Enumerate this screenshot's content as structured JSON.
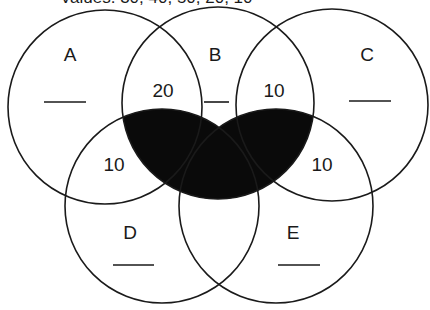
{
  "title": "Values: 30, 40, 50, 20, 10",
  "colors": {
    "stroke": "#1a1a1a",
    "shaded_region": "#0a0a0a",
    "background": "#ffffff"
  },
  "shaded_region_description": "B ∩ (D ∪ E)",
  "circles": [
    {
      "id": "A",
      "label": "A",
      "cx": 105,
      "cy": 107,
      "r": 97,
      "label_x": 70,
      "label_y": 56,
      "blank": {
        "x1": 44,
        "x2": 86,
        "y": 102
      }
    },
    {
      "id": "B",
      "label": "B",
      "cx": 218,
      "cy": 103,
      "r": 96,
      "label_x": 215,
      "label_y": 56,
      "blank": {
        "x1": 204,
        "x2": 229,
        "y": 102
      }
    },
    {
      "id": "C",
      "label": "C",
      "cx": 332,
      "cy": 105,
      "r": 96,
      "label_x": 367,
      "label_y": 56,
      "blank": {
        "x1": 349,
        "x2": 391,
        "y": 101
      }
    },
    {
      "id": "D",
      "label": "D",
      "cx": 162,
      "cy": 206,
      "r": 97,
      "label_x": 130,
      "label_y": 234,
      "blank": {
        "x1": 113,
        "x2": 154,
        "y": 265
      }
    },
    {
      "id": "E",
      "label": "E",
      "cx": 276,
      "cy": 206,
      "r": 97,
      "label_x": 293,
      "label_y": 234,
      "blank": {
        "x1": 278,
        "x2": 320,
        "y": 265
      }
    }
  ],
  "region_values": [
    {
      "region": "A∩B",
      "value": "20",
      "x": 163,
      "y": 92
    },
    {
      "region": "B∩C",
      "value": "10",
      "x": 274,
      "y": 92
    },
    {
      "region": "A∩D",
      "value": "10",
      "x": 114,
      "y": 166
    },
    {
      "region": "C∩E",
      "value": "10",
      "x": 322,
      "y": 166
    }
  ],
  "labels": {
    "A": "A",
    "B": "B",
    "C": "C",
    "D": "D",
    "E": "E"
  },
  "values": {
    "ab": "20",
    "bc": "10",
    "ad": "10",
    "ce": "10"
  }
}
